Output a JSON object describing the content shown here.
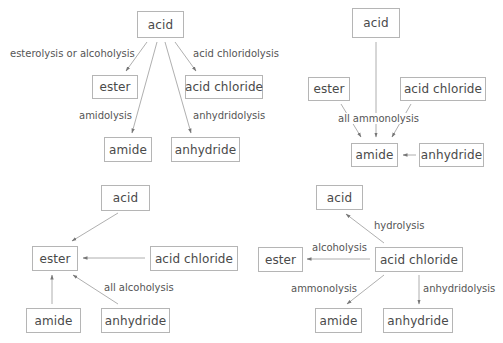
{
  "diagrams": {
    "tl": {
      "nodes": {
        "acid": "acid",
        "ester": "ester",
        "acid_chloride": "acid chloride",
        "amide": "amide",
        "anhydride": "anhydride"
      },
      "edges": [
        {
          "from": "acid",
          "to": "ester",
          "label": "esterolysis or alcoholysis"
        },
        {
          "from": "acid",
          "to": "acid chloride",
          "label": "acid chloridolysis"
        },
        {
          "from": "acid",
          "to": "amide",
          "label": "amidolysis"
        },
        {
          "from": "acid",
          "to": "anhydride",
          "label": "anhydridolysis"
        }
      ]
    },
    "tr": {
      "nodes": {
        "acid": "acid",
        "ester": "ester",
        "acid_chloride": "acid chloride",
        "amide": "amide",
        "anhydride": "anhydride"
      },
      "label": "all ammonolysis",
      "edges": [
        {
          "from": "acid",
          "to": "amide"
        },
        {
          "from": "ester",
          "to": "amide"
        },
        {
          "from": "acid chloride",
          "to": "amide"
        },
        {
          "from": "anhydride",
          "to": "amide"
        }
      ]
    },
    "bl": {
      "nodes": {
        "acid": "acid",
        "ester": "ester",
        "acid_chloride": "acid chloride",
        "amide": "amide",
        "anhydride": "anhydride"
      },
      "label": "all alcoholysis",
      "edges": [
        {
          "from": "acid",
          "to": "ester"
        },
        {
          "from": "acid chloride",
          "to": "ester"
        },
        {
          "from": "amide",
          "to": "ester"
        },
        {
          "from": "anhydride",
          "to": "ester"
        }
      ]
    },
    "br": {
      "nodes": {
        "acid": "acid",
        "ester": "ester",
        "acid_chloride": "acid chloride",
        "amide": "amide",
        "anhydride": "anhydride"
      },
      "edges": [
        {
          "from": "acid chloride",
          "to": "acid",
          "label": "hydrolysis"
        },
        {
          "from": "acid chloride",
          "to": "ester",
          "label": "alcoholysis"
        },
        {
          "from": "acid chloride",
          "to": "amide",
          "label": "ammonolysis"
        },
        {
          "from": "acid chloride",
          "to": "anhydride",
          "label": "anhydridolysis"
        }
      ]
    }
  }
}
